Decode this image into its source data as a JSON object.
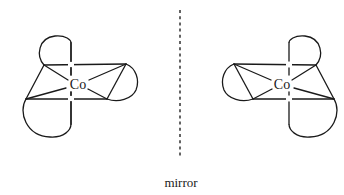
{
  "diagram": {
    "type": "enantiomer-pair",
    "molecules": [
      {
        "id": "left-enantiomer",
        "center_atom": "Co",
        "chelate_rings": 3
      },
      {
        "id": "right-enantiomer",
        "center_atom": "Co",
        "chelate_rings": 3
      }
    ],
    "mirror_label": "mirror"
  },
  "colors": {
    "stroke": "#1a1a1a",
    "background": "#ffffff"
  }
}
